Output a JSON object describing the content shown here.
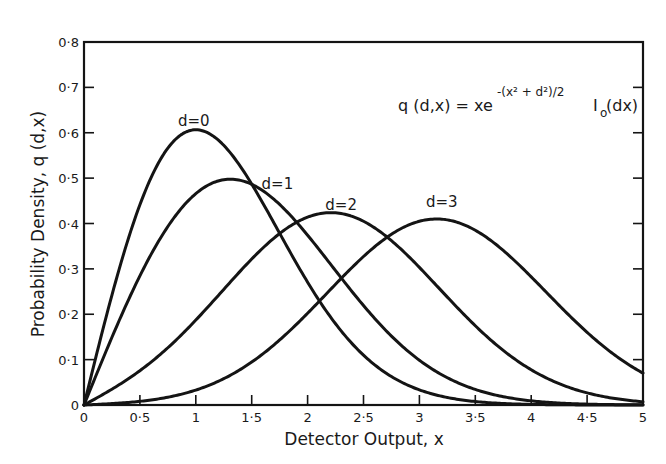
{
  "chart_data": {
    "type": "line",
    "title": "",
    "formula": {
      "lhs": "q (d,x) = xe",
      "exponent": "-(x² + d²)/2",
      "tail": "I",
      "tail_sub": "o",
      "tail_arg": " (dx)"
    },
    "xlabel": "Detector Output, x",
    "ylabel": "Probability Density, q (d,x)",
    "xlim": [
      0,
      5
    ],
    "ylim": [
      0,
      0.8
    ],
    "x_ticks": [
      0,
      0.5,
      1,
      1.5,
      2,
      2.5,
      3,
      3.5,
      4,
      4.5,
      5
    ],
    "x_tick_labels": [
      "0",
      "0·5",
      "1",
      "1·5",
      "2",
      "2·5",
      "3",
      "3·5",
      "4",
      "4·5",
      "5"
    ],
    "y_ticks": [
      0,
      0.1,
      0.2,
      0.3,
      0.4,
      0.5,
      0.6,
      0.7,
      0.8
    ],
    "y_tick_labels": [
      "0",
      "0·1",
      "0·2",
      "0·3",
      "0·4",
      "0·5",
      "0·6",
      "0·7",
      "0·8"
    ],
    "grid": false,
    "legend": "inline labels",
    "x": [
      0,
      0.25,
      0.5,
      0.75,
      1,
      1.25,
      1.5,
      1.75,
      2,
      2.25,
      2.5,
      2.75,
      3,
      3.25,
      3.5,
      3.75,
      4,
      4.25,
      4.5,
      4.75,
      5
    ],
    "series": [
      {
        "name": "d=0",
        "d": 0,
        "label": "d=0",
        "peak": [
          1.0,
          0.607
        ],
        "values": [
          0,
          0.242,
          0.441,
          0.566,
          0.607,
          0.572,
          0.487,
          0.379,
          0.271,
          0.179,
          0.11,
          0.063,
          0.033,
          0.016,
          0.008,
          0.003,
          0.001,
          0.0,
          0.0,
          0.0,
          0.0
        ]
      },
      {
        "name": "d=1",
        "d": 1,
        "label": "d=1",
        "peak": [
          1.3,
          0.5
        ],
        "values": [
          0,
          0.148,
          0.286,
          0.395,
          0.459,
          0.475,
          0.444,
          0.378,
          0.296,
          0.214,
          0.142,
          0.087,
          0.049,
          0.025,
          0.012,
          0.005,
          0.002,
          0.001,
          0.0,
          0.0,
          0.0
        ]
      },
      {
        "name": "d=2",
        "d": 2,
        "label": "d=2",
        "peak": [
          2.25,
          0.42
        ],
        "values": [
          0,
          0.036,
          0.08,
          0.14,
          0.206,
          0.275,
          0.335,
          0.381,
          0.408,
          0.414,
          0.397,
          0.361,
          0.309,
          0.248,
          0.188,
          0.135,
          0.091,
          0.058,
          0.035,
          0.02,
          0.011
        ]
      },
      {
        "name": "d=3",
        "d": 3,
        "label": "d=3",
        "peak": [
          3.2,
          0.4
        ],
        "values": [
          0,
          0.004,
          0.011,
          0.023,
          0.042,
          0.07,
          0.107,
          0.152,
          0.203,
          0.257,
          0.308,
          0.351,
          0.381,
          0.395,
          0.39,
          0.368,
          0.33,
          0.283,
          0.231,
          0.18,
          0.134
        ]
      }
    ]
  }
}
